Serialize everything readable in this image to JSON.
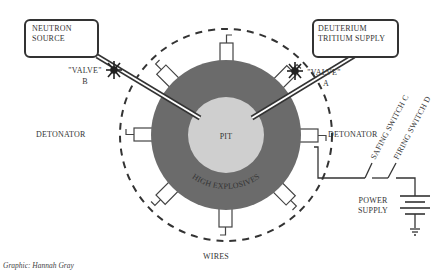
{
  "diagram": {
    "type": "nuclear-weapon-schematic",
    "colors": {
      "high_explosives": "#6b6b6b",
      "pit": "#cfcfcf",
      "line": "#333333",
      "background": "#ffffff"
    },
    "labels": {
      "neutron_source": [
        "NEUTRON",
        "SOURCE"
      ],
      "deuterium_tritium": [
        "DEUTERIUM",
        "TRITIUM SUPPLY"
      ],
      "valve_b": [
        "\"VALVE\"",
        "B"
      ],
      "valve_a": [
        "\"VALVE\"",
        "A"
      ],
      "pit": "PIT",
      "high_explosives": "HIGH EXPLOSIVES",
      "detonator_left": "DETONATOR",
      "detonator_right": "DETONATOR",
      "wires": "WIRES",
      "safing_switch": "SAFING SWITCH C",
      "firing_switch": "FIRING SWITCH D",
      "power_supply": [
        "POWER",
        "SUPPLY"
      ]
    },
    "credit": "Graphic: Hannah Gray"
  }
}
